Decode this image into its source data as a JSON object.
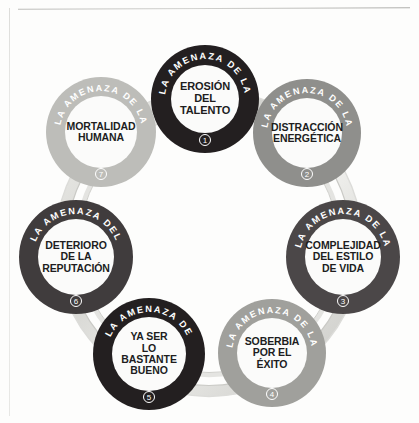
{
  "diagram": {
    "type": "cycle",
    "title": "",
    "node_count": 7,
    "connector_label": "ring-band",
    "nodes": [
      {
        "id": 1,
        "number": "1",
        "arc_text": "LA AMENAZA DE LA",
        "label": "EROSIÓN\nDEL\nTALENTO",
        "ring_color": "#231f20",
        "cx": 205,
        "cy": 99,
        "r": 54
      },
      {
        "id": 2,
        "number": "2",
        "arc_text": "LA AMENAZA DE LA",
        "label": "DISTRACCIÓN\nENERGÉTICA",
        "ring_color": "#8f8f8c",
        "cx": 307,
        "cy": 133,
        "r": 54
      },
      {
        "id": 3,
        "number": "3",
        "arc_text": "LA AMENAZA DE LA",
        "label": "COMPLEJIDAD\nDEL ESTILO\nDE VIDA",
        "ring_color": "#4b4748",
        "cx": 343,
        "cy": 257,
        "r": 57
      },
      {
        "id": 4,
        "number": "4",
        "arc_text": "LA AMENAZA DE LA",
        "label": "SOBERBIA\nPOR EL ÉXITO",
        "ring_color": "#a0a09c",
        "cx": 272,
        "cy": 353,
        "r": 54
      },
      {
        "id": 5,
        "number": "5",
        "arc_text": "LA AMENAZA DE",
        "label": "YA SER\nLO BASTANTE\nBUENO",
        "ring_color": "#231f20",
        "cx": 149,
        "cy": 354,
        "r": 56
      },
      {
        "id": 6,
        "number": "6",
        "arc_text": "LA AMENAZA DEL",
        "label": "DETERIORO\nDE LA\nREPUTACIÓN",
        "ring_color": "#403c3d",
        "cx": 76,
        "cy": 257,
        "r": 57
      },
      {
        "id": 7,
        "number": "7",
        "arc_text": "LA AMENAZA DE LA",
        "label": "MORTALIDAD\nHUMANA",
        "ring_color": "#bdbdb9",
        "cx": 101,
        "cy": 132,
        "r": 55
      }
    ],
    "band": {
      "color_light": "#e9e9e6",
      "color_mid": "#d2d2ce",
      "color_shadow": "#bdbdb9",
      "description": "light gray ribbon ring connecting all seven circles"
    },
    "page": {
      "background": "#fdfdfc",
      "rule_color": "#bebebb"
    }
  }
}
